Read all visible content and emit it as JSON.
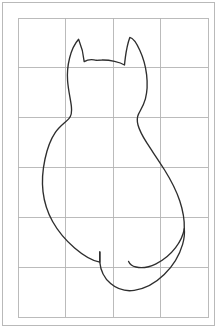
{
  "page": {
    "width": 220,
    "height": 332,
    "background_color": "#ffffff"
  },
  "frame": {
    "name": "outer-frame",
    "x": 2.5,
    "y": 2.5,
    "width": 212,
    "height": 323,
    "stroke_color": "#b9b9b9",
    "fill_color": "#ffffff"
  },
  "grid": {
    "name": "layout-grid",
    "left": 18,
    "top": 18,
    "right": 208,
    "bottom": 317,
    "columns": 4,
    "rows": 6,
    "cell_width": 47.5,
    "cell_height": 49.83,
    "line_color": "#b4b4b4",
    "vertical_lines_x": [
      18,
      65.5,
      113,
      160.5,
      208
    ],
    "horizontal_lines_y": [
      18,
      67.8,
      117.7,
      167.5,
      217.3,
      267.2,
      317
    ]
  },
  "figure": {
    "name": "cat-silhouette",
    "view": "rear-facing seated cat",
    "style": "outline",
    "stroke_color": "#2e2e2e",
    "stroke_width": 1.35,
    "fill": "none",
    "body_path": "M 96.5 60.3 C 92.0 59.2 87.5 59.6 84.2 61.6 C 83.6 55.0 81.6 46.6 78.6 39.3 C 75.2 43.1 71.6 50.0 69.6 58.0 C 67.8 65.2 67.0 73.5 67.6 81.0 C 68.3 90.0 70.6 99.8 71.4 106.6 C 72.1 112.6 71.2 116.0 68.9 118.6 C 65.4 122.5 59.8 125.8 55.2 132.6 C 50.4 139.7 47.0 149.6 45.0 159.0 C 42.6 170.2 41.8 181.4 43.0 191.6 C 44.3 202.8 47.8 212.9 52.6 221.5 C 58.4 231.9 66.0 240.6 74.6 248.0 C 83.0 255.2 92.2 260.8 99.8 262.2 L 99.8 252.0",
    "lower_body_path": "M 99.8 252.0 L 99.8 262.2 C 100.6 270.6 104.6 278.4 110.6 283.6 C 117.0 289.1 125.6 291.6 134.2 290.4 C 145.0 288.9 155.6 283.0 164.2 274.6 C 172.8 266.2 179.4 255.4 182.6 244.4 C 184.2 238.9 184.8 233.6 184.3 228.9",
    "right_body_path": "M 184.3 228.9 C 184.6 220.0 183.0 210.6 179.8 201.0 C 176.2 190.2 170.6 179.6 164.6 170.0 C 158.4 160.0 152.0 151.0 147.0 143.2 C 142.6 136.3 139.4 130.2 138.0 125.0 C 136.8 120.5 137.0 117.4 138.4 114.4 C 140.4 110.2 143.6 105.6 145.4 98.8 C 147.2 92.0 147.6 83.2 146.6 74.6 C 145.6 66.0 143.2 57.6 139.8 50.2 C 136.6 43.2 132.8 38.0 129.8 37.4 C 127.8 43.0 126.2 51.0 125.4 57.2 C 124.9 61.0 124.6 63.9 124.5 65.0 C 120.0 62.0 110.0 59.8 101.8 60.0 C 99.8 60.0 98.0 60.1 96.5 60.3",
    "tail_path": "M 184.3 228.9 C 183.2 235.2 180.2 241.6 175.6 247.6 C 170.4 254.4 163.4 260.2 156.0 263.8 C 149.0 267.2 141.8 268.4 136.0 267.0 C 132.4 266.1 129.8 264.2 128.6 261.4"
  },
  "labels": {
    "visible_text": ""
  }
}
